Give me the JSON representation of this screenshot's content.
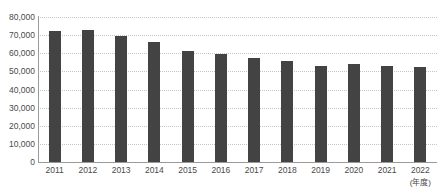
{
  "chart_data": {
    "type": "bar",
    "title": "",
    "xlabel": "(年度)",
    "ylabel": "",
    "categories": [
      "2011",
      "2012",
      "2013",
      "2014",
      "2015",
      "2016",
      "2017",
      "2018",
      "2019",
      "2020",
      "2021",
      "2022"
    ],
    "values": [
      72500,
      73000,
      69500,
      66000,
      61000,
      59500,
      57500,
      56000,
      53000,
      54000,
      53000,
      52500
    ],
    "ylim": [
      0,
      80000
    ],
    "ytick_labels": [
      "0",
      "10,000",
      "20,000",
      "30,000",
      "40,000",
      "50,000",
      "60,000",
      "70,000",
      "80,000"
    ],
    "ytick_values": [
      0,
      10000,
      20000,
      30000,
      40000,
      50000,
      60000,
      70000,
      80000
    ],
    "grid": "horizontal-dotted",
    "legend": "none",
    "bar_color": "#434343",
    "gridline_color": "#c5c5c5",
    "axis_color": "#9a9a9a"
  },
  "heading": {
    "text": "",
    "color": "#c9c9c9"
  }
}
